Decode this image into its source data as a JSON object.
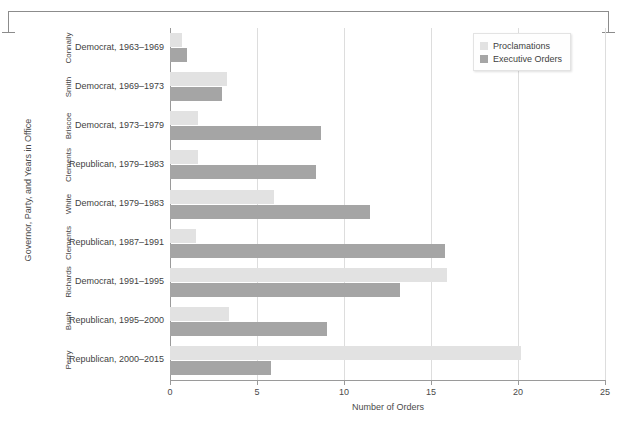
{
  "chart_data": {
    "type": "bar",
    "orientation": "horizontal",
    "title": "",
    "xlabel": "Number of Orders",
    "ylabel": "Governor, Party, and Years in Office",
    "xlim": [
      0,
      25
    ],
    "xticks": [
      0,
      5,
      10,
      15,
      20,
      25
    ],
    "grid": "vertical",
    "legend_position": "top-right",
    "categories": [
      "Connally",
      "Smith",
      "Briscoe",
      "Clements",
      "White",
      "Clements",
      "Richards",
      "Bush",
      "Perry"
    ],
    "category_sublabels": [
      "Democrat, 1963–1969",
      "Democrat, 1969–1973",
      "Democrat, 1973–1979",
      "Republican, 1979–1983",
      "Democrat, 1979–1983",
      "Republican, 1987–1991",
      "Democrat, 1991–1995",
      "Republican, 1995–2000",
      "Republican, 2000–2015"
    ],
    "series": [
      {
        "name": "Proclamations",
        "color": "#e2e2e2",
        "values": [
          0.7,
          3.3,
          1.6,
          1.6,
          6.0,
          1.5,
          15.9,
          3.4,
          20.2
        ]
      },
      {
        "name": "Executive Orders",
        "color": "#a5a5a5",
        "values": [
          1.0,
          3.0,
          8.7,
          8.4,
          11.5,
          15.8,
          13.2,
          9.0,
          5.8
        ]
      }
    ]
  },
  "legend": {
    "items": [
      {
        "label": "Proclamations",
        "color": "#e2e2e2"
      },
      {
        "label": "Executive Orders",
        "color": "#a5a5a5"
      }
    ]
  },
  "axes": {
    "x_title": "Number of Orders",
    "y_title": "Governor, Party, and Years in Office",
    "x_tick_labels": [
      "0",
      "5",
      "10",
      "15",
      "20",
      "25"
    ]
  }
}
